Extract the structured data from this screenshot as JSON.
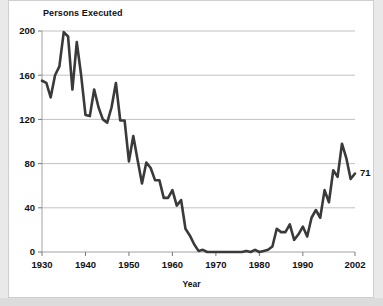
{
  "chart_data": {
    "type": "line",
    "title": "Persons Executed",
    "xlabel": "Year",
    "ylabel": "",
    "grid": true,
    "legend": false,
    "xlim": [
      1930,
      2002
    ],
    "ylim": [
      0,
      200
    ],
    "yticks": [
      0,
      40,
      80,
      120,
      160,
      200
    ],
    "ytick_labels": [
      "0",
      "40",
      "80",
      "120",
      "160",
      "200"
    ],
    "xticks": [
      1930,
      1940,
      1950,
      1960,
      1970,
      1980,
      1990,
      2002
    ],
    "xtick_labels": [
      "1930",
      "1940",
      "1950",
      "1960",
      "1970",
      "1980",
      "1990",
      "2002"
    ],
    "annotations": [
      {
        "text": "71",
        "x": 2002,
        "y": 71
      }
    ],
    "series": [
      {
        "name": "Persons Executed",
        "color": "#3a3a3a",
        "x": [
          1930,
          1931,
          1932,
          1933,
          1934,
          1935,
          1936,
          1937,
          1938,
          1939,
          1940,
          1941,
          1942,
          1943,
          1944,
          1945,
          1946,
          1947,
          1948,
          1949,
          1950,
          1951,
          1952,
          1953,
          1954,
          1955,
          1956,
          1957,
          1958,
          1959,
          1960,
          1961,
          1962,
          1963,
          1964,
          1965,
          1966,
          1967,
          1968,
          1969,
          1970,
          1971,
          1972,
          1973,
          1974,
          1975,
          1976,
          1977,
          1978,
          1979,
          1980,
          1981,
          1982,
          1983,
          1984,
          1985,
          1986,
          1987,
          1988,
          1989,
          1990,
          1991,
          1992,
          1993,
          1994,
          1995,
          1996,
          1997,
          1998,
          1999,
          2000,
          2001,
          2002
        ],
        "values": [
          155,
          153,
          140,
          160,
          168,
          199,
          195,
          147,
          190,
          160,
          124,
          123,
          147,
          131,
          120,
          117,
          131,
          153,
          119,
          119,
          82,
          105,
          83,
          62,
          81,
          76,
          65,
          65,
          49,
          49,
          56,
          42,
          47,
          21,
          15,
          7,
          1,
          2,
          0,
          0,
          0,
          0,
          0,
          0,
          0,
          0,
          0,
          1,
          0,
          2,
          0,
          1,
          2,
          5,
          21,
          18,
          18,
          25,
          11,
          16,
          23,
          14,
          31,
          38,
          31,
          56,
          45,
          74,
          68,
          98,
          85,
          66,
          71
        ]
      }
    ]
  },
  "figure": {
    "title": "Persons Executed",
    "xaxis_title": "Year",
    "end_value_label": "71"
  }
}
